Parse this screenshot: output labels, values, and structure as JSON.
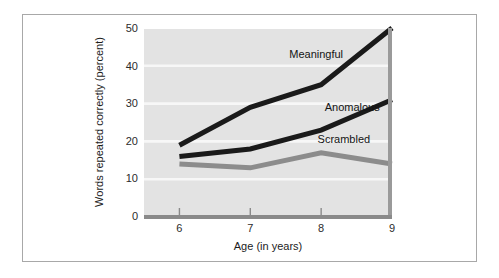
{
  "figure": {
    "background_color": "#ffffff",
    "frame_color": "#a8a8a8",
    "plot_background_color": "#e3e3e3",
    "gridline_color": "#f7f7f7",
    "axis_color": "#8a8a8a"
  },
  "chart_data": {
    "type": "line",
    "title": "",
    "xlabel": "Age (in years)",
    "ylabel": "Words repeated correctly (percent)",
    "x": [
      6,
      7,
      8,
      9
    ],
    "xticklabels": [
      "6",
      "7",
      "8",
      "9"
    ],
    "xlim": [
      5.5,
      9.0
    ],
    "ylim": [
      0,
      50
    ],
    "yticks": [
      0,
      10,
      20,
      30,
      40,
      50
    ],
    "yticklabels": [
      "0",
      "10",
      "20",
      "30",
      "40",
      "50"
    ],
    "grid": "horizontal",
    "legend": "inline-labels",
    "series": [
      {
        "name": "Meaningful",
        "color": "#1a1a1a",
        "values": [
          19,
          29,
          35,
          50
        ]
      },
      {
        "name": "Anomalous",
        "color": "#1a1a1a",
        "values": [
          16,
          18,
          23,
          31
        ]
      },
      {
        "name": "Scrambled",
        "color": "#8c8c8c",
        "values": [
          14,
          13,
          17,
          14
        ]
      }
    ],
    "annotations": [
      {
        "text": "Meaningful",
        "x": 7.55,
        "y": 42
      },
      {
        "text": "Anomalous",
        "x": 8.05,
        "y": 28
      },
      {
        "text": "Scrambled",
        "x": 7.95,
        "y": 19.5
      }
    ]
  }
}
